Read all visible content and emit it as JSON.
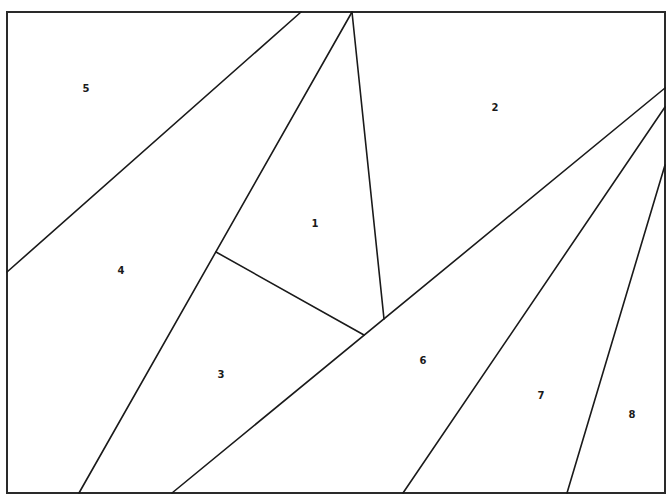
{
  "diagram": {
    "type": "paper-piecing pattern",
    "frame": {
      "x": 7,
      "y": 12,
      "width": 658,
      "height": 481
    },
    "seams": [
      {
        "id": "seam-5-4",
        "x1": 301,
        "y1": 12,
        "x2": 7,
        "y2": 272
      },
      {
        "id": "seam-4-1-3",
        "x1": 352,
        "y1": 12,
        "x2": 79,
        "y2": 493
      },
      {
        "id": "seam-1-2",
        "x1": 352,
        "y1": 12,
        "x2": 384,
        "y2": 319
      },
      {
        "id": "seam-1-3",
        "x1": 216,
        "y1": 252,
        "x2": 364,
        "y2": 335
      },
      {
        "id": "seam-2-6",
        "x1": 665,
        "y1": 88,
        "x2": 172,
        "y2": 493
      },
      {
        "id": "seam-6-7",
        "x1": 665,
        "y1": 107,
        "x2": 403,
        "y2": 493
      },
      {
        "id": "seam-7-8",
        "x1": 665,
        "y1": 165,
        "x2": 567,
        "y2": 493
      }
    ],
    "pieces": [
      {
        "label": "1",
        "x": 315,
        "y": 224
      },
      {
        "label": "2",
        "x": 495,
        "y": 108
      },
      {
        "label": "3",
        "x": 221,
        "y": 375
      },
      {
        "label": "4",
        "x": 121,
        "y": 271
      },
      {
        "label": "5",
        "x": 86,
        "y": 89
      },
      {
        "label": "6",
        "x": 423,
        "y": 361
      },
      {
        "label": "7",
        "x": 541,
        "y": 396
      },
      {
        "label": "8",
        "x": 632,
        "y": 415
      }
    ]
  }
}
